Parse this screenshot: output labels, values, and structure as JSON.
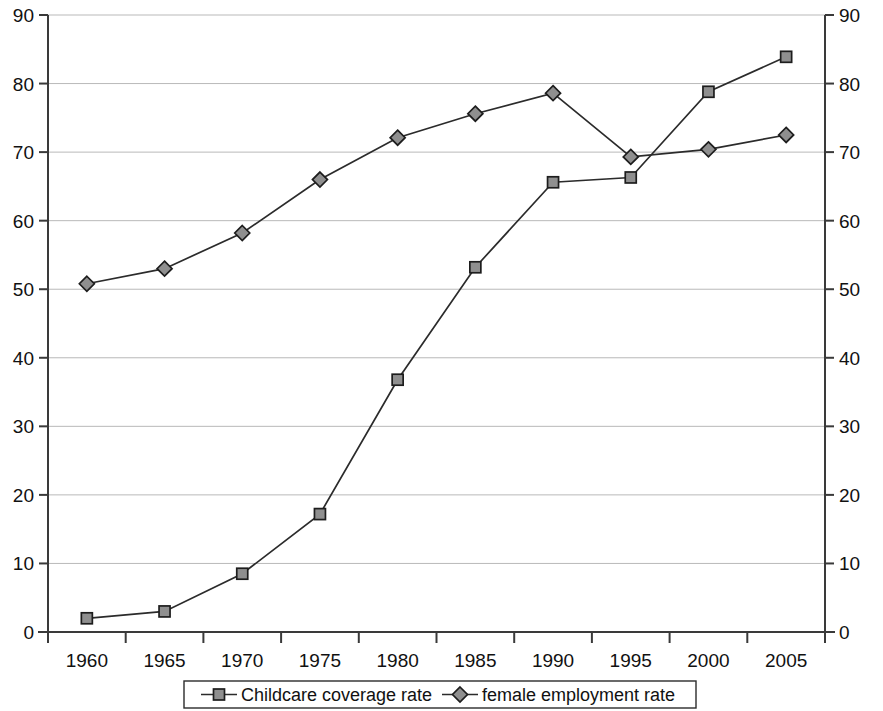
{
  "chart_data": {
    "type": "line",
    "title": "",
    "xlabel": "",
    "ylabel": "",
    "xlim": [
      1957.5,
      2007.5
    ],
    "ylim": [
      0,
      90
    ],
    "ytick_step": 10,
    "grid": true,
    "legend_position": "bottom",
    "dual_y_axis": true,
    "x": [
      1960,
      1965,
      1970,
      1975,
      1980,
      1985,
      1990,
      1995,
      2000,
      2005
    ],
    "categories": [
      "1960",
      "1965",
      "1970",
      "1975",
      "1980",
      "1985",
      "1990",
      "1995",
      "2000",
      "2005"
    ],
    "ytick_labels": [
      "0",
      "10",
      "20",
      "30",
      "40",
      "50",
      "60",
      "70",
      "80",
      "90"
    ],
    "ytick_values": [
      0,
      10,
      20,
      30,
      40,
      50,
      60,
      70,
      80,
      90
    ],
    "series": [
      {
        "name": "Childcare coverage rate",
        "marker": "square",
        "color": "#2b2b2b",
        "marker_fill": "#8f8f8f",
        "values": [
          2.0,
          3.0,
          8.5,
          17.2,
          36.8,
          53.2,
          65.6,
          66.3,
          78.8,
          83.9
        ]
      },
      {
        "name": "female employment rate",
        "marker": "diamond",
        "color": "#2b2b2b",
        "marker_fill": "#8f8f8f",
        "values": [
          50.8,
          53.0,
          58.2,
          66.0,
          72.1,
          75.6,
          78.6,
          69.3,
          70.4,
          72.5
        ]
      }
    ]
  },
  "legend": {
    "items": [
      {
        "label": "Childcare coverage rate",
        "marker": "square"
      },
      {
        "label": "female employment rate",
        "marker": "diamond"
      }
    ]
  }
}
